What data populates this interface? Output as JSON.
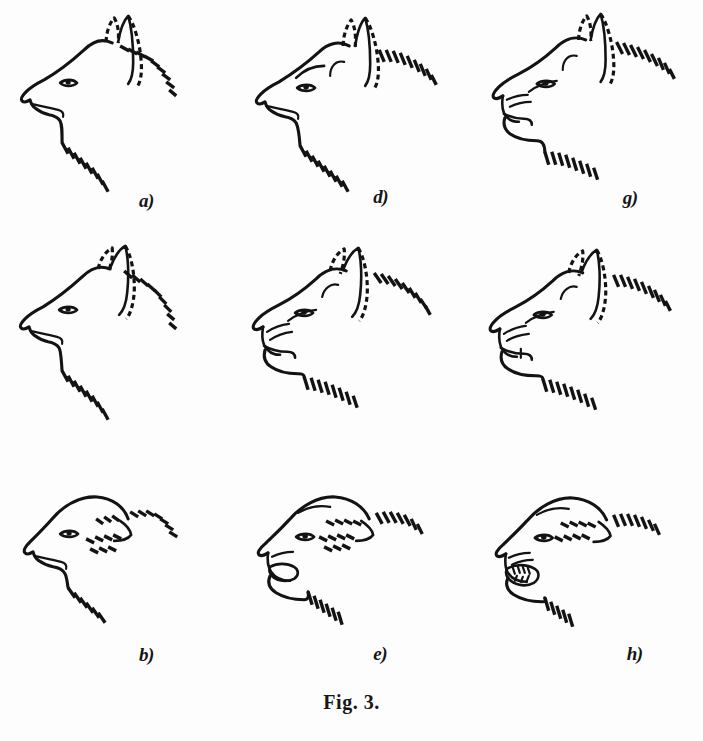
{
  "figure": {
    "caption": "Fig. 3.",
    "background_color": "#fdfdfd",
    "ink_color": "#131313",
    "layout": "3 columns x 3 rows grid of dog head profiles, all facing left",
    "panel_count": 9
  },
  "panels": [
    {
      "id": "a",
      "label": "a)",
      "grid_position": "row 1, column 1",
      "description": "neutral relaxed dog head profile, facing left, ears erect and forward, mouth closed, smooth brow, neck hackles hatched",
      "ears": "erect-forward",
      "mouth": "closed",
      "aggression_level": 0,
      "fear_level": 0
    },
    {
      "id": "b",
      "label": "b)",
      "grid_position": "row 2, column 1",
      "description": "ears flattened back, mouth closed, slightly fearful, neck hatching",
      "ears": "back-partly",
      "mouth": "closed",
      "aggression_level": 0,
      "fear_level": 1
    },
    {
      "id": "c",
      "label": "c)",
      "grid_position": "row 3, column 1",
      "description": "ears fully flattened back against head, mouth closed, maximally fearful submissive",
      "ears": "flat-back",
      "mouth": "closed",
      "aggression_level": 0,
      "fear_level": 2
    },
    {
      "id": "d",
      "label": "d)",
      "grid_position": "row 1, column 2",
      "description": "ears erect forward, brow furrowed, mouth closed, mild threat",
      "ears": "erect-forward",
      "mouth": "closed",
      "aggression_level": 1,
      "fear_level": 0
    },
    {
      "id": "e",
      "label": "e)",
      "grid_position": "row 2, column 2",
      "description": "ears partly back, muzzle wrinkled, mouth open showing teeth, snarl",
      "ears": "back-partly",
      "mouth": "open-snarl",
      "aggression_level": 1,
      "fear_level": 1
    },
    {
      "id": "f",
      "label": "f)",
      "grid_position": "row 3, column 2",
      "description": "ears flat back, mouth open wide, defensive snarl with fear",
      "ears": "flat-back",
      "mouth": "open",
      "aggression_level": 1,
      "fear_level": 2
    },
    {
      "id": "g",
      "label": "g)",
      "grid_position": "row 1, column 3",
      "description": "ears erect forward, nose heavily wrinkled, lips retracted showing canines, full offensive threat",
      "ears": "erect-forward",
      "mouth": "open-bare-teeth",
      "aggression_level": 2,
      "fear_level": 0
    },
    {
      "id": "h",
      "label": "h)",
      "grid_position": "row 2, column 3",
      "description": "ears partly back, strongly wrinkled muzzle, teeth bared, mixed threat and fear",
      "ears": "back-partly",
      "mouth": "open-bare-teeth",
      "aggression_level": 2,
      "fear_level": 1
    },
    {
      "id": "i",
      "label": "i)",
      "grid_position": "row 3, column 3",
      "description": "ears flat back, muzzle wrinkled, mouth wide open with full teeth showing, maximal threat and fear",
      "ears": "flat-back",
      "mouth": "open-bare-teeth",
      "aggression_level": 2,
      "fear_level": 2
    }
  ]
}
